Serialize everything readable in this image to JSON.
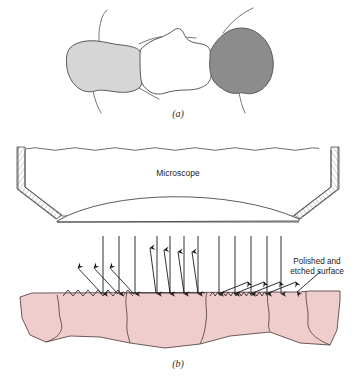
{
  "figure": {
    "panels": [
      {
        "id": "a",
        "label": "(a)",
        "description": "Three adjacent metal grains with different crystallographic orientations shown in different shades",
        "grains": [
          {
            "name": "left-grain",
            "shade": "#d6d6d6",
            "tone": "light gray"
          },
          {
            "name": "center-grain",
            "shade": "#ffffff",
            "tone": "white"
          },
          {
            "name": "right-grain",
            "shade": "#8c8c8c",
            "tone": "dark gray"
          }
        ],
        "outline_color": "#555555"
      },
      {
        "id": "b",
        "label": "(b)",
        "description": "Microscope above a polished and etched surface; incident light rays reflect from grooved grain boundaries and flat grain faces",
        "microscope_label": "Microscope",
        "surface_label_line1": "Polished and",
        "surface_label_line2": "etched surface",
        "material_color": "#f0cdcd",
        "material_outline": "#5a4a46",
        "ray_color": "#1a1a1a",
        "microscope_outline": "#4a4a4a",
        "incident_ray_count": 12,
        "reflected_ray_count": 12
      }
    ]
  }
}
